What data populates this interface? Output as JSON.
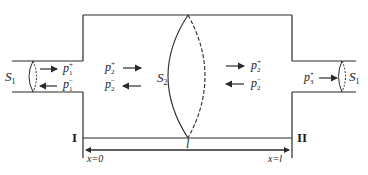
{
  "diagram": {
    "surfaces": {
      "left_inlet": {
        "symbol": "S",
        "sub": "1"
      },
      "middle": {
        "symbol": "S",
        "sub": "2"
      },
      "right_outlet": {
        "symbol": "S",
        "sub": "1"
      }
    },
    "waves": {
      "inlet_incident": {
        "symbol": "p",
        "sub": "1",
        "sup": "+"
      },
      "inlet_reflected": {
        "symbol": "p",
        "sub": "1",
        "sup": "−"
      },
      "chamber_left_incident": {
        "symbol": "p",
        "sub": "2",
        "sup": "+"
      },
      "chamber_left_reflected": {
        "symbol": "p",
        "sub": "2",
        "sup": "−"
      },
      "chamber_right_incident": {
        "symbol": "p",
        "sub": "2",
        "sup": "+"
      },
      "chamber_right_reflected": {
        "symbol": "p",
        "sub": "2",
        "sup": "−"
      },
      "outlet_transmitted": {
        "symbol": "p",
        "sub": "3",
        "sup": "+"
      }
    },
    "boundaries": {
      "left": "I",
      "right": "II"
    },
    "length_label": "l",
    "positions": {
      "start": "x=0",
      "end": "x=l"
    },
    "colors": {
      "line": "#2a2a2a",
      "text": "#1a1a1a",
      "background": "#ffffff"
    }
  }
}
